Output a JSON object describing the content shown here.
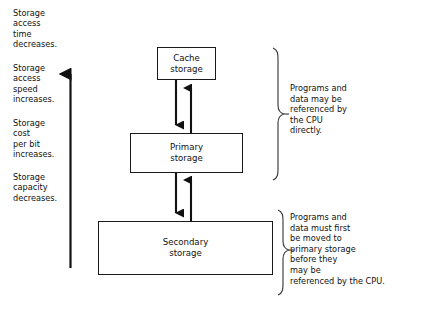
{
  "diagram": {
    "stroke_color": "#1a1a1a",
    "text_color": "#111111",
    "background": "#ffffff"
  },
  "left_labels": [
    {
      "id": "access-time",
      "text": "Storage\naccess\ntime\ndecreases."
    },
    {
      "id": "access-speed",
      "text": "Storage\naccess\nspeed\nincreases."
    },
    {
      "id": "cost-per-bit",
      "text": "Storage\ncost\nper bit\nincreases."
    },
    {
      "id": "capacity",
      "text": "Storage\ncapacity\ndecreases."
    }
  ],
  "arrow": {
    "direction": "up",
    "name": "hierarchy-direction-arrow"
  },
  "boxes": [
    {
      "id": "cache",
      "label": "Cache\nstorage"
    },
    {
      "id": "primary",
      "label": "Primary\nstorage"
    },
    {
      "id": "secondary",
      "label": "Secondary\nstorage"
    }
  ],
  "connectors": [
    {
      "id": "cache-to-primary-down",
      "direction": "down"
    },
    {
      "id": "primary-to-cache-up",
      "direction": "up"
    },
    {
      "id": "primary-to-secondary-down",
      "direction": "down"
    },
    {
      "id": "secondary-to-primary-up",
      "direction": "up"
    }
  ],
  "annotations": [
    {
      "id": "direct-access",
      "text": "Programs and\ndata may be\nreferenced by\nthe CPU\ndirectly."
    },
    {
      "id": "indirect-access",
      "text": "Programs and\ndata must first\nbe moved to\nprimary storage\nbefore they\nmay be\nreferenced by the CPU."
    }
  ]
}
